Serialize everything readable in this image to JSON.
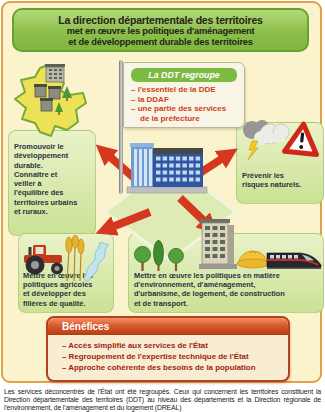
{
  "title": {
    "line1": "La direction départementale des territoires",
    "line2": "met en œuvre les politiques d'aménagement",
    "line3": "et de développement durable des territoires"
  },
  "flag": {
    "header": "La DDT regroupe",
    "lines": [
      "– l'essentiel de la DDE",
      "– la DDAF",
      "– une partie des services",
      "de la préfecture"
    ]
  },
  "missions": {
    "promote": "Promouvoir le\ndéveloppement\ndurable.\nConnaître et\nveiller à\nl'équilibre des\nterritoires urbains\net ruraux.",
    "prevent": "Prévenir les\nrisques naturels.",
    "agriculture": "Mettre en œuvre les\npolitiques agricoles\net développer des\nfilières de qualité.",
    "policies": "Mettre en œuvre les politiques en matière\nd'environnement, d'aménagement,\nd'urbanisme, de logement, de construction\net de transport."
  },
  "benefits": {
    "title": "Bénéfices",
    "items": [
      "– Accès simplifié aux services de l'État",
      "– Regroupement de l'expertise technique de l'État",
      "– Approche cohérente des besoins de la population"
    ]
  },
  "caption": {
    "text": "Les services déconcentrés de l'État ont été regroupés. Ceux qui concernent les territoires constituent la Direction départementale des territoires (DDT) au niveau des départements et la Direction régionale de l'environnement, de l'aménagement et du logement (DREAL)"
  },
  "icons": {
    "map": "france-map-icon",
    "storm": "storm-cloud-icon",
    "warning": "warning-triangle-icon",
    "building": "ddt-building-icon",
    "tractor": "tractor-icon",
    "wheat": "wheat-icon",
    "river": "river-icon",
    "tree": "tree-icon",
    "cypress": "cypress-tree-icon",
    "apartment": "apartment-building-icon",
    "hardhat": "hard-hat-icon",
    "train": "tgv-train-icon",
    "arrows": "red-arrow-icon"
  },
  "colors": {
    "page_bg": "#FBF3CC",
    "frame_border": "#E0A149",
    "title_green": "#8CBE4B",
    "title_border": "#67A132",
    "vignette_green": "#D9E8A9",
    "arrow_red": "#D5371F",
    "flag_band_green": "#7CBA42",
    "flag_text_red": "#CD4023",
    "benefits_border": "#B5401E",
    "benefits_text": "#9E2410",
    "body_text": "#2A3340"
  }
}
